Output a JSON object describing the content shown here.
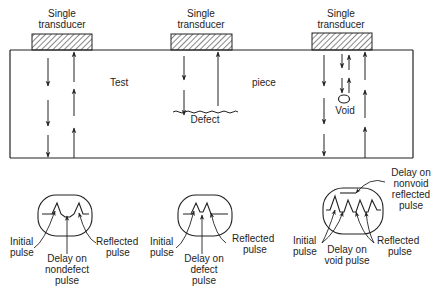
{
  "transducers": [
    {
      "line1": "Single",
      "line2": "transducer"
    },
    {
      "line1": "Single",
      "line2": "transducer"
    },
    {
      "line1": "Single",
      "line2": "transducer"
    }
  ],
  "test_piece": {
    "word1": "Test",
    "word2": "piece"
  },
  "defect_label": "Defect",
  "void_label": "Void",
  "scopes": [
    {
      "name": "nondefect",
      "labels": {
        "initial": [
          "Initial",
          "pulse"
        ],
        "delay": [
          "Delay on",
          "nondefect",
          "pulse"
        ],
        "reflected": [
          "Reflected",
          "pulse"
        ]
      }
    },
    {
      "name": "defect",
      "labels": {
        "initial": [
          "Initial",
          "pulse"
        ],
        "delay": [
          "Delay on",
          "defect",
          "pulse"
        ],
        "reflected": [
          "Reflected",
          "pulse"
        ]
      }
    },
    {
      "name": "void",
      "labels": {
        "initial": [
          "Initial",
          "pulse"
        ],
        "delay": [
          "Delay on",
          "void pulse"
        ],
        "reflected": [
          "Reflected",
          "pulse"
        ],
        "nonvoid": [
          "Delay on",
          "nonvoid",
          "reflected",
          "pulse"
        ]
      }
    }
  ],
  "colors": {
    "ink": "#222222",
    "background": "#ffffff"
  }
}
